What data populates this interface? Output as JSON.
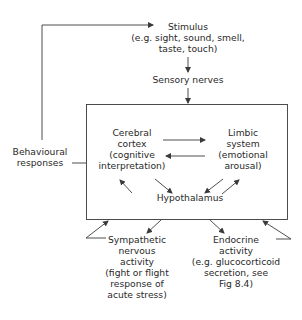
{
  "diagram": {
    "stimulus": {
      "title": "Stimulus",
      "line2": "(e.g. sight, sound, smell,",
      "line3": "taste, touch)"
    },
    "sensory_nerves": "Sensory nerves",
    "behavioural": {
      "line1": "Behavioural",
      "line2": "responses"
    },
    "cerebral_cortex": {
      "line1": "Cerebral",
      "line2": "cortex",
      "line3": "(cognitive",
      "line4": "interpretation)"
    },
    "limbic_system": {
      "line1": "Limbic",
      "line2": "system",
      "line3": "(emotional",
      "line4": "arousal)"
    },
    "hypothalamus": "Hypothalamus",
    "sympathetic": {
      "line1": "Sympathetic",
      "line2": "nervous",
      "line3": "activity",
      "line4": "(fight or flight",
      "line5": "response of",
      "line6": "acute stress)"
    },
    "endocrine": {
      "line1": "Endocrine",
      "line2": "activity",
      "line3": "(e.g. glucocorticoid",
      "line4": "secretion, see",
      "line5": "Fig 8.4)"
    },
    "colors": {
      "line": "#3a3a3a",
      "text": "#2a2a2a",
      "background": "#ffffff"
    }
  }
}
